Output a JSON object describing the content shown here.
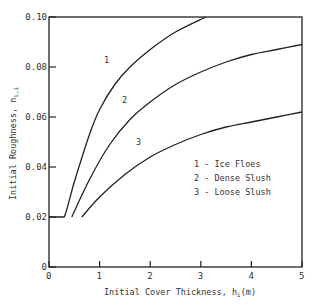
{
  "chart_data": {
    "type": "line",
    "title": "",
    "xlabel": "Initial Cover Thickness, h_i(m)",
    "ylabel": "Initial Roughness, n_i,i",
    "xlim": [
      0,
      5
    ],
    "ylim": [
      0,
      0.1
    ],
    "x_ticks": [
      "0",
      "1",
      "2",
      "3",
      "4",
      "5"
    ],
    "y_ticks": [
      "0",
      "0.02",
      "0.04",
      "0.06",
      "0.08",
      "0.10"
    ],
    "grid": false,
    "legend_position": "inside-right",
    "legend": [
      "1 - Ice Floes",
      "2 - Dense Slush",
      "3 - Loose Slush"
    ],
    "series": [
      {
        "name": "1 - Ice Floes",
        "label": "1",
        "x": [
          0.0,
          0.15,
          0.3,
          0.5,
          0.8,
          1.0,
          1.3,
          1.6,
          2.0,
          2.5,
          3.1
        ],
        "values": [
          0.02,
          0.02,
          0.02,
          0.034,
          0.053,
          0.063,
          0.073,
          0.08,
          0.087,
          0.094,
          0.1
        ]
      },
      {
        "name": "2 - Dense Slush",
        "label": "2",
        "x": [
          0.45,
          0.8,
          1.2,
          1.6,
          2.0,
          2.5,
          3.0,
          3.5,
          4.0,
          4.5,
          5.0
        ],
        "values": [
          0.02,
          0.035,
          0.049,
          0.059,
          0.066,
          0.073,
          0.078,
          0.082,
          0.085,
          0.087,
          0.089
        ]
      },
      {
        "name": "3 - Loose Slush",
        "label": "3",
        "x": [
          0.65,
          1.0,
          1.5,
          2.0,
          2.5,
          3.0,
          3.5,
          4.0,
          4.5,
          5.0
        ],
        "values": [
          0.02,
          0.028,
          0.037,
          0.044,
          0.049,
          0.053,
          0.056,
          0.058,
          0.06,
          0.062
        ]
      }
    ]
  },
  "labels": {
    "xlabel_main": "Initial Cover Thickness, h",
    "xlabel_sub": "i",
    "xlabel_unit": "(m)",
    "ylabel_main": "Initial Roughness, n",
    "ylabel_sub": "i,i",
    "curve1": "1",
    "curve2": "2",
    "curve3": "3",
    "legend1": "1 - Ice Floes",
    "legend2": "2 - Dense Slush",
    "legend3": "3 - Loose Slush"
  }
}
